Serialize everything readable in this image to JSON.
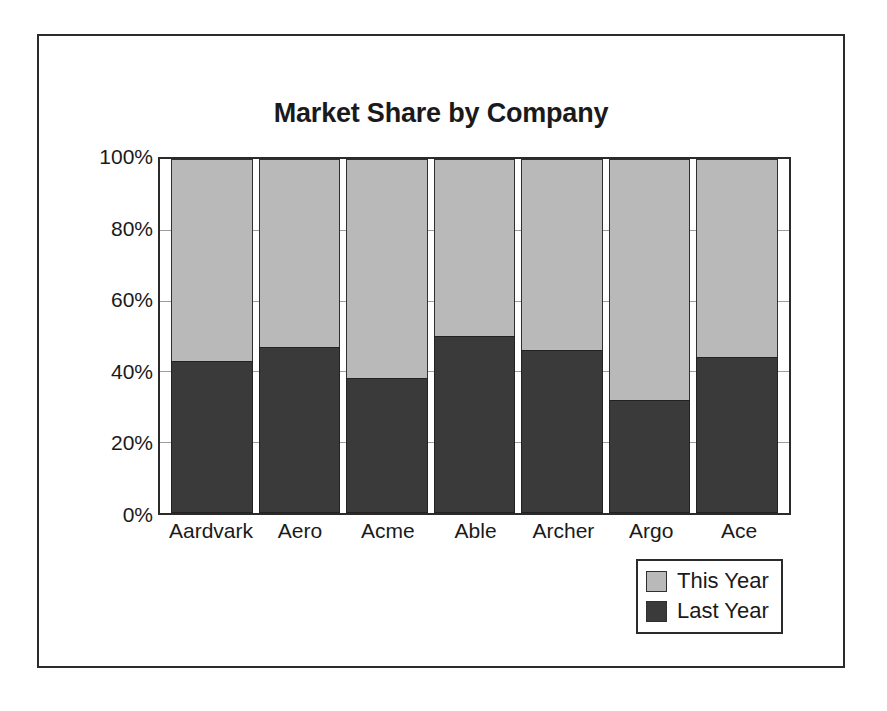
{
  "figure": {
    "background_color": "#ffffff",
    "frame_color": "#2b2b2b"
  },
  "chart_data": {
    "type": "bar",
    "subtype": "stacked-vertical-100-percent",
    "title": "Market Share by Company",
    "subtitle": "",
    "xlabel": "",
    "ylabel": "",
    "categories": [
      "Aardvark",
      "Aero",
      "Acme",
      "Able",
      "Archer",
      "Argo",
      "Ace"
    ],
    "series": [
      {
        "name": "Last Year",
        "color": "#3a3a3a",
        "values": [
          43,
          47,
          38,
          50,
          46,
          32,
          44
        ]
      },
      {
        "name": "This Year",
        "color": "#b9b9b9",
        "values": [
          57,
          53,
          62,
          50,
          54,
          68,
          56
        ]
      }
    ],
    "stack_order_bottom_to_top": [
      "Last Year",
      "This Year"
    ],
    "ylim": [
      0,
      100
    ],
    "yticks": [
      0,
      20,
      40,
      60,
      80,
      100
    ],
    "ytick_labels": [
      "0%",
      "20%",
      "40%",
      "60%",
      "80%",
      "100%"
    ],
    "grid": true,
    "grid_axis": "y",
    "legend_position": "bottom-right-outside",
    "annotations": []
  },
  "legend": {
    "entries": [
      {
        "label": "This Year",
        "color": "#b9b9b9"
      },
      {
        "label": "Last Year",
        "color": "#3a3a3a"
      }
    ]
  }
}
